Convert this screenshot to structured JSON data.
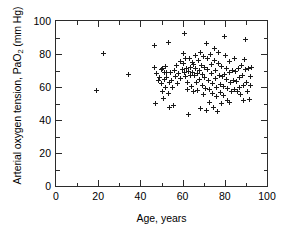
{
  "chart_data": {
    "type": "scatter",
    "title": "",
    "xlabel": "Age, years",
    "ylabel_text": "Arterial oxygen tension, PaO",
    "ylabel_sub": "2",
    "ylabel_tail": " (mm Hg)",
    "ylabel_full": "Arterial oxygen tension, PaO2 (mm Hg)",
    "xlim": [
      0,
      100
    ],
    "ylim": [
      0,
      100
    ],
    "x_major_ticks": [
      0,
      20,
      40,
      60,
      80,
      100
    ],
    "y_major_ticks": [
      0,
      20,
      40,
      60,
      80,
      100
    ],
    "x_minor_step": 10,
    "y_minor_step": 10,
    "x_tick_labels": [
      "0",
      "20",
      "40",
      "60",
      "80",
      "100"
    ],
    "y_tick_labels": [
      "0",
      "20",
      "40",
      "60",
      "80",
      "100"
    ],
    "grid": false,
    "legend": false,
    "marker": "plus",
    "marker_color": "#1a1a1a",
    "frame_color": "#2b2b2b",
    "background": "#ffffff",
    "n_points": 141,
    "points": [
      [
        19.0,
        58.0
      ],
      [
        22.3,
        80.3
      ],
      [
        34.2,
        67.8
      ],
      [
        46.5,
        85.2
      ],
      [
        46.8,
        72.0
      ],
      [
        47.0,
        50.0
      ],
      [
        47.4,
        68.2
      ],
      [
        48.6,
        63.8
      ],
      [
        49.2,
        65.5
      ],
      [
        49.8,
        70.5
      ],
      [
        50.1,
        62.0
      ],
      [
        50.4,
        71.5
      ],
      [
        50.6,
        57.0
      ],
      [
        50.9,
        53.2
      ],
      [
        51.2,
        68.8
      ],
      [
        51.5,
        64.5
      ],
      [
        51.8,
        72.2
      ],
      [
        52.0,
        60.0
      ],
      [
        52.3,
        69.0
      ],
      [
        52.6,
        66.0
      ],
      [
        53.1,
        87.2
      ],
      [
        53.4,
        55.8
      ],
      [
        53.6,
        62.5
      ],
      [
        54.0,
        47.8
      ],
      [
        54.5,
        68.5
      ],
      [
        54.8,
        64.0
      ],
      [
        55.2,
        59.5
      ],
      [
        55.6,
        49.0
      ],
      [
        56.0,
        70.0
      ],
      [
        56.4,
        66.5
      ],
      [
        57.0,
        72.8
      ],
      [
        57.6,
        62.0
      ],
      [
        58.2,
        68.0
      ],
      [
        58.8,
        75.5
      ],
      [
        59.2,
        65.0
      ],
      [
        59.8,
        70.8
      ],
      [
        60.2,
        80.5
      ],
      [
        60.5,
        74.0
      ],
      [
        60.8,
        68.5
      ],
      [
        61.0,
        92.5
      ],
      [
        61.3,
        77.0
      ],
      [
        61.6,
        66.2
      ],
      [
        61.9,
        71.5
      ],
      [
        62.2,
        63.0
      ],
      [
        62.5,
        58.5
      ],
      [
        62.8,
        69.5
      ],
      [
        63.0,
        43.5
      ],
      [
        63.3,
        77.5
      ],
      [
        63.6,
        72.0
      ],
      [
        63.9,
        67.0
      ],
      [
        64.2,
        60.5
      ],
      [
        64.5,
        75.0
      ],
      [
        64.8,
        69.0
      ],
      [
        65.0,
        57.5
      ],
      [
        65.3,
        73.5
      ],
      [
        65.6,
        66.8
      ],
      [
        66.0,
        79.0
      ],
      [
        66.3,
        71.0
      ],
      [
        66.6,
        62.8
      ],
      [
        66.9,
        68.2
      ],
      [
        67.2,
        58.0
      ],
      [
        67.5,
        75.8
      ],
      [
        67.8,
        70.2
      ],
      [
        68.0,
        64.5
      ],
      [
        68.3,
        47.0
      ],
      [
        68.6,
        81.0
      ],
      [
        68.9,
        73.0
      ],
      [
        69.2,
        67.5
      ],
      [
        69.5,
        61.0
      ],
      [
        69.8,
        55.5
      ],
      [
        70.0,
        78.5
      ],
      [
        70.3,
        71.8
      ],
      [
        70.6,
        66.0
      ],
      [
        70.9,
        59.0
      ],
      [
        71.2,
        45.5
      ],
      [
        71.5,
        86.5
      ],
      [
        71.8,
        77.2
      ],
      [
        72.0,
        70.5
      ],
      [
        72.3,
        64.0
      ],
      [
        72.6,
        58.2
      ],
      [
        72.9,
        50.5
      ],
      [
        73.2,
        79.5
      ],
      [
        73.5,
        73.8
      ],
      [
        73.8,
        68.0
      ],
      [
        74.0,
        62.0
      ],
      [
        74.3,
        56.0
      ],
      [
        74.6,
        47.5
      ],
      [
        74.9,
        83.5
      ],
      [
        75.2,
        76.0
      ],
      [
        75.5,
        69.8
      ],
      [
        75.8,
        65.0
      ],
      [
        76.0,
        59.8
      ],
      [
        76.3,
        54.0
      ],
      [
        76.6,
        45.0
      ],
      [
        76.9,
        80.8
      ],
      [
        77.2,
        74.5
      ],
      [
        77.5,
        67.2
      ],
      [
        77.8,
        61.5
      ],
      [
        78.0,
        56.5
      ],
      [
        78.3,
        50.0
      ],
      [
        78.6,
        72.5
      ],
      [
        78.9,
        66.5
      ],
      [
        79.2,
        60.2
      ],
      [
        79.5,
        55.0
      ],
      [
        79.8,
        67.8
      ],
      [
        80.0,
        90.8
      ],
      [
        80.3,
        79.0
      ],
      [
        80.6,
        71.0
      ],
      [
        80.9,
        64.8
      ],
      [
        81.2,
        59.0
      ],
      [
        81.5,
        52.0
      ],
      [
        82.0,
        75.2
      ],
      [
        82.4,
        68.5
      ],
      [
        82.8,
        62.5
      ],
      [
        83.2,
        57.0
      ],
      [
        83.6,
        70.0
      ],
      [
        84.0,
        64.0
      ],
      [
        84.4,
        58.5
      ],
      [
        84.8,
        77.0
      ],
      [
        85.2,
        69.5
      ],
      [
        85.6,
        63.5
      ],
      [
        86.0,
        57.5
      ],
      [
        86.4,
        71.5
      ],
      [
        86.8,
        66.0
      ],
      [
        87.2,
        60.0
      ],
      [
        87.6,
        55.5
      ],
      [
        88.0,
        73.0
      ],
      [
        88.4,
        67.0
      ],
      [
        88.8,
        61.0
      ],
      [
        89.2,
        76.8
      ],
      [
        89.6,
        70.8
      ],
      [
        90.0,
        88.5
      ],
      [
        90.4,
        63.0
      ],
      [
        90.8,
        57.0
      ],
      [
        91.2,
        71.2
      ],
      [
        91.6,
        52.2
      ],
      [
        92.0,
        66.5
      ],
      [
        92.4,
        60.8
      ],
      [
        92.8,
        71.8
      ],
      [
        89.0,
        51.8
      ],
      [
        82.0,
        50.5
      ]
    ]
  }
}
